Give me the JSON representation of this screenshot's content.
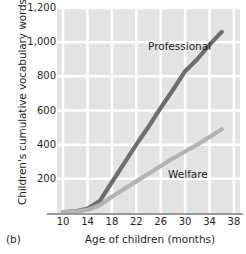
{
  "panel_label": "(b)",
  "axes": {
    "y_title": "Children's cumulative vocabulary words",
    "x_title": "Age of children (months)",
    "y_ticks": [
      "200",
      "400",
      "600",
      "800",
      "1,000",
      "1,200"
    ],
    "x_ticks": [
      "10",
      "14",
      "18",
      "22",
      "26",
      "30",
      "34",
      "38"
    ]
  },
  "annotations": {
    "professional": "Professional",
    "welfare": "Welfare"
  },
  "colors": {
    "professional": "#6e6e6e",
    "welfare": "#b3b3b3",
    "plot_background": "#e3e3e3",
    "gridline": "#ffffff",
    "axis": "#9a9a9a",
    "text": "#231f20"
  },
  "chart_data": {
    "type": "line",
    "title": "",
    "xlabel": "Age of children (months)",
    "ylabel": "Children's cumulative vocabulary words",
    "xlim": [
      9,
      39
    ],
    "ylim": [
      0,
      1200
    ],
    "xticks": [
      10,
      14,
      18,
      22,
      26,
      30,
      34,
      38
    ],
    "yticks": [
      200,
      400,
      600,
      800,
      1000,
      1200
    ],
    "grid": true,
    "legend": "inline-annotations",
    "series": [
      {
        "name": "Professional",
        "color": "#6e6e6e",
        "x": [
          10,
          12,
          14,
          16,
          18,
          20,
          22,
          24,
          26,
          28,
          30,
          32,
          34,
          36
        ],
        "values": [
          5,
          10,
          25,
          70,
          180,
          290,
          400,
          505,
          615,
          720,
          830,
          900,
          985,
          1060
        ]
      },
      {
        "name": "Welfare",
        "color": "#b3b3b3",
        "x": [
          10,
          12,
          14,
          16,
          18,
          20,
          22,
          24,
          26,
          28,
          30,
          32,
          34,
          36
        ],
        "values": [
          5,
          8,
          18,
          45,
          95,
          140,
          185,
          230,
          275,
          320,
          360,
          400,
          445,
          490
        ]
      }
    ]
  }
}
